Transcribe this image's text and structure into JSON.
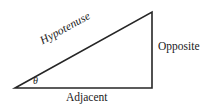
{
  "figure": {
    "background_color": "#ffffff",
    "stroke_color": "#262626",
    "text_color": "#1a1a1a",
    "width": 208,
    "height": 110,
    "labels": {
      "hypotenuse": "Hypotenuse",
      "opposite": "Opposite",
      "adjacent": "Adjacent",
      "angle": "θ"
    },
    "geometry": {
      "vertex_left": {
        "x": 15,
        "y": 88
      },
      "vertex_bottom_right": {
        "x": 152,
        "y": 88
      },
      "vertex_top_right": {
        "x": 152,
        "y": 12
      },
      "sides": [
        {
          "name": "adjacent",
          "from": "vertex_left",
          "to": "vertex_bottom_right"
        },
        {
          "name": "opposite",
          "from": "vertex_bottom_right",
          "to": "vertex_top_right"
        },
        {
          "name": "hypotenuse",
          "from": "vertex_top_right",
          "to": "vertex_left"
        }
      ],
      "angle_marker": {
        "at": "vertex_left",
        "label": "θ",
        "radius": 20
      },
      "hypotenuse_rotation_deg": -28.8
    }
  }
}
